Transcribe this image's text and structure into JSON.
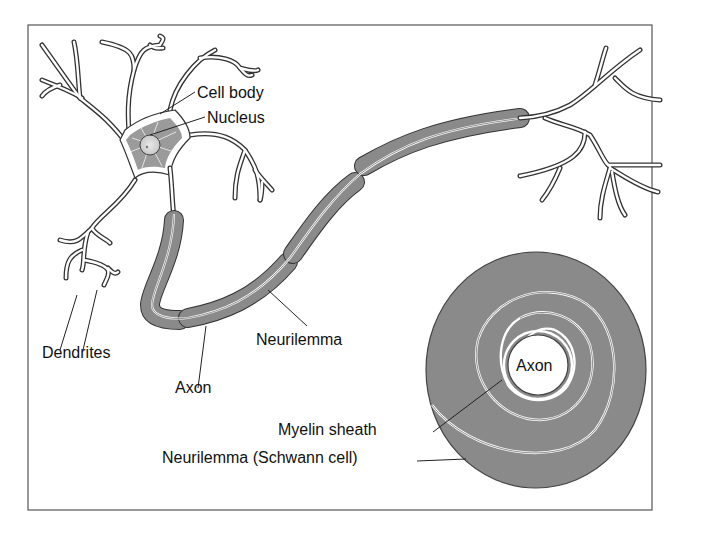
{
  "diagram": {
    "type": "neuron-anatomy",
    "labels": {
      "cell_body": "Cell body",
      "nucleus": "Nucleus",
      "dendrites": "Dendrites",
      "axon": "Axon",
      "neurilemma": "Neurilemma",
      "cross_section_axon": "Axon",
      "myelin_sheath": "Myelin sheath",
      "neurilemma_schwann": "Neurilemma (Schwann cell)"
    },
    "colors": {
      "sheath_fill": "#8a8a8a",
      "sheath_dark": "#6e6e6e",
      "outline": "#333333",
      "cell_body_hatch": "#9a9a9a",
      "background": "#ffffff",
      "frame": "#555555"
    }
  }
}
